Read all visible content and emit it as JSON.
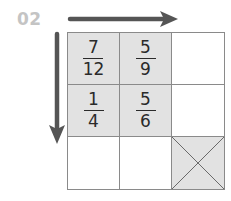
{
  "problem": {
    "number": "02"
  },
  "arrows": {
    "horizontal": {
      "direction": "right",
      "color": "#555555"
    },
    "vertical": {
      "direction": "down",
      "color": "#555555"
    }
  },
  "grid": {
    "rows": 3,
    "cols": 3,
    "cells": [
      [
        {
          "numerator": "7",
          "denominator": "12",
          "shaded": true
        },
        {
          "numerator": "5",
          "denominator": "9",
          "shaded": true
        },
        {
          "numerator": "",
          "denominator": "",
          "shaded": false
        }
      ],
      [
        {
          "numerator": "1",
          "denominator": "4",
          "shaded": true
        },
        {
          "numerator": "5",
          "denominator": "6",
          "shaded": true
        },
        {
          "numerator": "",
          "denominator": "",
          "shaded": false
        }
      ],
      [
        {
          "numerator": "",
          "denominator": "",
          "shaded": false
        },
        {
          "numerator": "",
          "denominator": "",
          "shaded": false
        },
        {
          "numerator": "",
          "denominator": "",
          "shaded": true,
          "crossed": true
        }
      ]
    ]
  },
  "colors": {
    "shade": "#e2e2e2",
    "grid_line": "#8a8a8a",
    "label": "#c4c4c4",
    "text": "#2a2a2a"
  }
}
